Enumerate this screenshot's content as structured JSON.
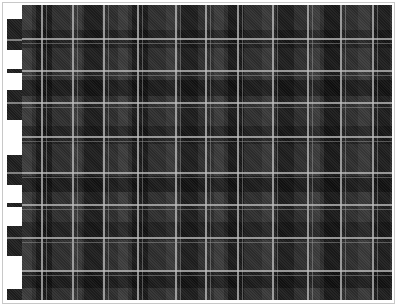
{
  "image": {
    "subject": "tartan plaid fabric swatch",
    "colors": {
      "base": "#2e2e2e",
      "dark_band": "#141414",
      "light_line": "#bebebe",
      "border": "#c8c8c8",
      "background": "#ffffff"
    },
    "vertical_lines_x": [
      41,
      72,
      103,
      137,
      175,
      205,
      237,
      272,
      307,
      340,
      372
    ],
    "horizontal_lines_y": [
      38,
      70,
      102,
      136,
      172,
      204,
      237,
      270
    ],
    "left_edge_tabs": [
      {
        "top": 19,
        "height": 31,
        "stripe": 39
      },
      {
        "top": 69,
        "height": 4,
        "stripe": 70
      },
      {
        "top": 90,
        "height": 30,
        "stripe": 102
      },
      {
        "top": 155,
        "height": 30,
        "stripe": 172
      },
      {
        "top": 203,
        "height": 4,
        "stripe": 204
      },
      {
        "top": 226,
        "height": 30,
        "stripe": 237
      },
      {
        "top": 289,
        "height": 11,
        "stripe": null
      }
    ]
  }
}
